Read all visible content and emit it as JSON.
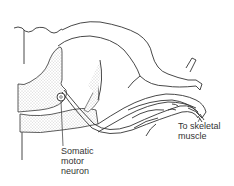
{
  "diagram": {
    "labels": {
      "somatic_motor_neuron": "Somatic\nmotor\nneuron",
      "to_skeletal_muscle": "To skeletal\nmuscle"
    },
    "colors": {
      "line": "#333333",
      "stipple": "#9a9a9a",
      "background": "#ffffff"
    }
  }
}
